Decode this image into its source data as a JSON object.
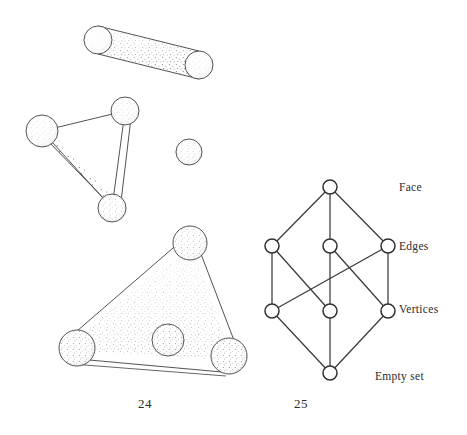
{
  "page": {
    "background_color": "#ffffff",
    "ink_color": "#3a3a3a",
    "text_color": "#2b2b2b"
  },
  "figure_24": {
    "caption": "24",
    "description": "Simplices: a point, a segment, a hollow triangle, and a solid triangle",
    "shapes": [
      {
        "name": "edge-rod",
        "type": "segment",
        "balls": [
          {
            "cx": 98,
            "cy": 40,
            "r": 14
          },
          {
            "cx": 199,
            "cy": 65,
            "r": 14
          }
        ],
        "stipple": "shaded-tube"
      },
      {
        "name": "hollow-triangle",
        "type": "triangle-outline",
        "balls": [
          {
            "cx": 42,
            "cy": 131,
            "r": 16
          },
          {
            "cx": 125,
            "cy": 111,
            "r": 14
          },
          {
            "cx": 112,
            "cy": 208,
            "r": 14
          }
        ],
        "stipple": "edges-only"
      },
      {
        "name": "isolated-vertex-ball",
        "type": "point",
        "balls": [
          {
            "cx": 189,
            "cy": 152,
            "r": 13
          }
        ],
        "stipple": "light"
      },
      {
        "name": "solid-triangle",
        "type": "triangle-filled",
        "balls": [
          {
            "cx": 77,
            "cy": 348,
            "r": 18
          },
          {
            "cx": 190,
            "cy": 243,
            "r": 17
          },
          {
            "cx": 229,
            "cy": 356,
            "r": 18
          },
          {
            "cx": 168,
            "cy": 340,
            "r": 16
          }
        ],
        "stipple": "filled-interior"
      }
    ]
  },
  "figure_25": {
    "caption": "25",
    "description": "Face lattice (Hasse diagram) of a triangle",
    "levels": [
      {
        "id": "face",
        "label": "Face",
        "y": 187,
        "label_x": 399,
        "label_y": 181
      },
      {
        "id": "edges",
        "label": "Edges",
        "y": 246,
        "label_x": 399,
        "label_y": 240
      },
      {
        "id": "vertices",
        "label": "Vertices",
        "y": 311,
        "label_x": 399,
        "label_y": 303
      },
      {
        "id": "emptyset",
        "label": "Empty set",
        "y": 373,
        "label_x": 375,
        "label_y": 370
      }
    ],
    "nodes": [
      {
        "id": "F",
        "level": "face",
        "cx": 330,
        "cy": 187,
        "r": 7
      },
      {
        "id": "E1",
        "level": "edges",
        "cx": 272,
        "cy": 246,
        "r": 7
      },
      {
        "id": "E2",
        "level": "edges",
        "cx": 330,
        "cy": 246,
        "r": 7
      },
      {
        "id": "E3",
        "level": "edges",
        "cx": 388,
        "cy": 246,
        "r": 7
      },
      {
        "id": "V1",
        "level": "vertices",
        "cx": 272,
        "cy": 311,
        "r": 7
      },
      {
        "id": "V2",
        "level": "vertices",
        "cx": 330,
        "cy": 311,
        "r": 7
      },
      {
        "id": "V3",
        "level": "vertices",
        "cx": 388,
        "cy": 311,
        "r": 7
      },
      {
        "id": "O",
        "level": "emptyset",
        "cx": 330,
        "cy": 373,
        "r": 7
      }
    ],
    "edges": [
      [
        "F",
        "E1"
      ],
      [
        "F",
        "E2"
      ],
      [
        "F",
        "E3"
      ],
      [
        "E1",
        "V1"
      ],
      [
        "E1",
        "V2"
      ],
      [
        "E2",
        "V2"
      ],
      [
        "E2",
        "V3"
      ],
      [
        "E3",
        "V3"
      ],
      [
        "E3",
        "V1"
      ],
      [
        "V1",
        "O"
      ],
      [
        "V2",
        "O"
      ],
      [
        "V3",
        "O"
      ]
    ]
  }
}
